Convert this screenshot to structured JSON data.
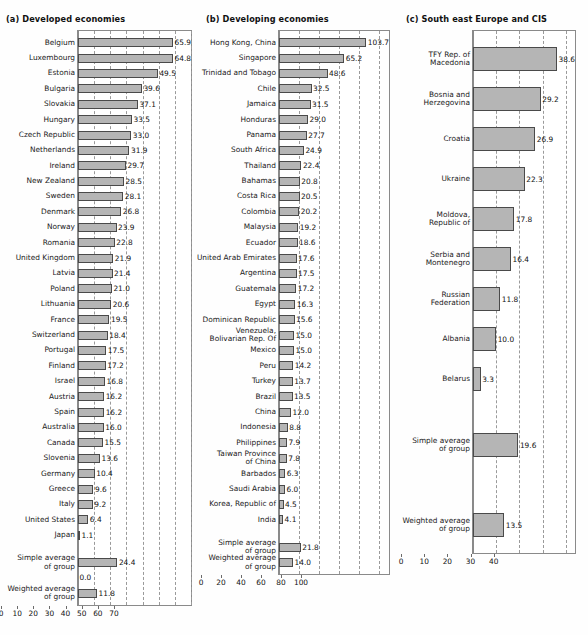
{
  "figure": {
    "bar_color": "#b5b5b5",
    "bar_border_color": "#4a4a4a",
    "grid_color": "#9a9a9a",
    "background": "#ffffff"
  },
  "chart_data": [
    {
      "type": "bar",
      "orientation": "horizontal",
      "title": "(a) Developed economies",
      "xlabel": "",
      "ylabel": "",
      "xlim": [
        0,
        70
      ],
      "xticks": [
        0,
        10,
        20,
        30,
        40,
        50,
        60,
        70
      ],
      "grid": true,
      "legend": "none",
      "categories": [
        "Belgium",
        "Luxembourg",
        "Estonia",
        "Bulgaria",
        "Slovakia",
        "Hungary",
        "Czech Republic",
        "Netherlands",
        "Ireland",
        "New Zealand",
        "Sweden",
        "Denmark",
        "Norway",
        "Romania",
        "United Kingdom",
        "Latvia",
        "Poland",
        "Lithuania",
        "France",
        "Switzerland",
        "Portugal",
        "Finland",
        "Israel",
        "Austria",
        "Spain",
        "Australia",
        "Canada",
        "Slovenia",
        "Germany",
        "Greece",
        "Italy",
        "United States",
        "Japan"
      ],
      "values": [
        65.9,
        64.8,
        49.5,
        39.6,
        37.1,
        33.5,
        33.0,
        31.9,
        29.7,
        28.5,
        28.1,
        26.8,
        23.9,
        22.8,
        21.9,
        21.4,
        21.0,
        20.6,
        19.5,
        18.4,
        17.5,
        17.2,
        16.8,
        16.2,
        16.2,
        16.0,
        15.5,
        13.6,
        10.4,
        9.6,
        9.2,
        6.4,
        1.1
      ],
      "summary": [
        {
          "label": "Simple average\nof group",
          "value": 24.4
        },
        {
          "label": "",
          "value": 0.0
        },
        {
          "label": "Weighted average\nof group",
          "value": 11.8
        }
      ]
    },
    {
      "type": "bar",
      "orientation": "horizontal",
      "title": "(b) Developing economies",
      "xlabel": "",
      "ylabel": "",
      "xlim": [
        0,
        110
      ],
      "xticks": [
        0,
        20,
        40,
        60,
        80,
        100
      ],
      "grid": true,
      "legend": "none",
      "categories": [
        "Hong Kong, China",
        "Singapore",
        "Trinidad and Tobago",
        "Chile",
        "Jamaica",
        "Honduras",
        "Panama",
        "South Africa",
        "Thailand",
        "Bahamas",
        "Costa Rica",
        "Colombia",
        "Malaysia",
        "Ecuador",
        "United Arab Emirates",
        "Argentina",
        "Guatemala",
        "Egypt",
        "Dominican Republic",
        "Venezuela,\nBolivarian Rep. Of",
        "Mexico",
        "Peru",
        "Turkey",
        "Brazil",
        "China",
        "Indonesia",
        "Philippines",
        "Taiwan Province\nof China",
        "Barbados",
        "Saudi Arabia",
        "Korea, Republic of",
        "India"
      ],
      "values": [
        103.7,
        65.2,
        48.6,
        32.5,
        31.5,
        29.0,
        27.7,
        24.9,
        22.4,
        20.8,
        20.5,
        20.2,
        19.2,
        18.6,
        17.6,
        17.5,
        17.2,
        16.3,
        15.6,
        15.0,
        15.0,
        14.2,
        13.7,
        13.5,
        12.0,
        8.8,
        7.9,
        7.8,
        6.3,
        6.0,
        4.5,
        4.1
      ],
      "summary": [
        {
          "label": "Simple average\nof group",
          "value": 21.8
        },
        {
          "label": "Weighted average\nof group",
          "value": 14.0
        }
      ]
    },
    {
      "type": "bar",
      "orientation": "horizontal",
      "title": "(c) South east Europe and CIS",
      "xlabel": "",
      "ylabel": "",
      "xlim": [
        0,
        44
      ],
      "xticks": [
        0,
        10,
        20,
        30,
        40
      ],
      "grid": true,
      "legend": "none",
      "categories": [
        "TFY Rep. of\nMacedonia",
        "Bosnia and\nHerzegovina",
        "Croatia",
        "Ukraine",
        "Moldova,\nRepublic of",
        "Serbia and\nMontenegro",
        "Russian\nFederation",
        "Albania",
        "Belarus"
      ],
      "values": [
        38.6,
        29.2,
        26.9,
        22.3,
        17.8,
        16.4,
        11.8,
        10.0,
        3.3
      ],
      "summary": [
        {
          "label": "Simple average\nof group",
          "value": 19.6
        },
        {
          "label": "Weighted average\nof group",
          "value": 13.5
        }
      ]
    }
  ]
}
